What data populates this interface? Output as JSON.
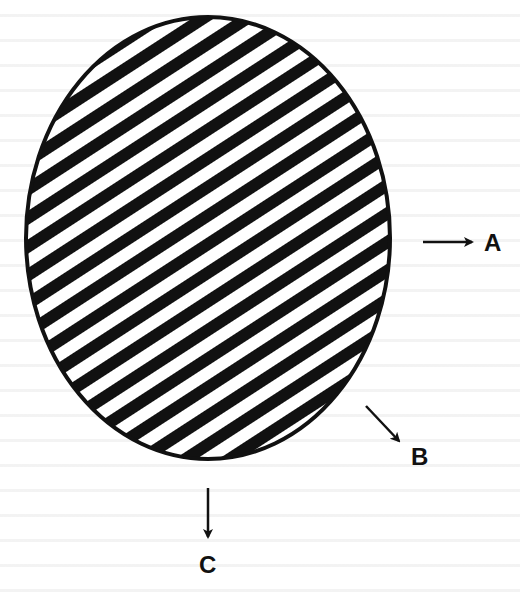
{
  "diagram": {
    "shape": "hatched-ellipse",
    "fill_pattern": "diagonal-stripes",
    "colors": {
      "ink": "#111111",
      "paper": "#ffffff"
    },
    "ellipse": {
      "cx": 208,
      "cy": 238,
      "rx": 182,
      "ry": 221
    },
    "stripes": {
      "angle_deg": -33,
      "period_px": 24,
      "black_px": 12
    },
    "arrows": [
      {
        "id": "A",
        "direction": "right",
        "label": "A"
      },
      {
        "id": "B",
        "direction": "down-right",
        "label": "B"
      },
      {
        "id": "C",
        "direction": "down",
        "label": "C"
      }
    ]
  }
}
